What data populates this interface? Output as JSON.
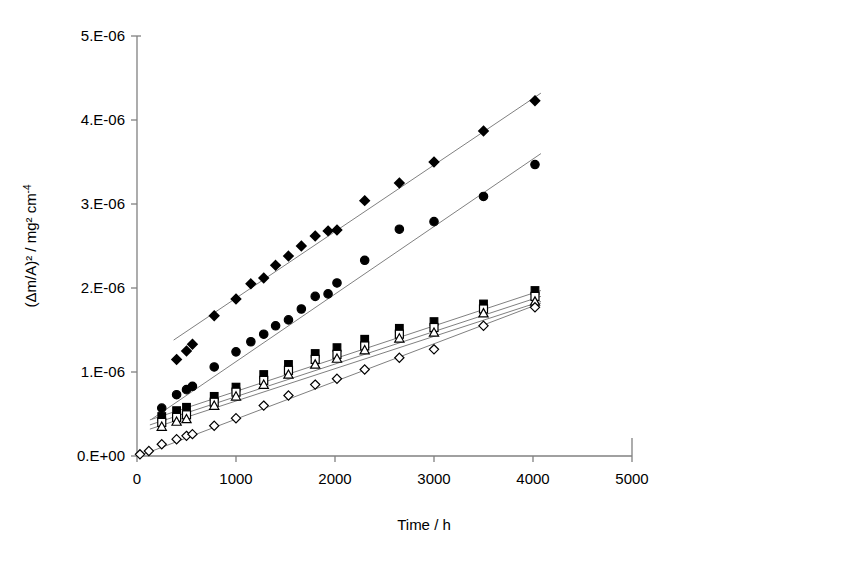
{
  "figure": {
    "background_color": "#ffffff",
    "axis_color": "#808080",
    "marker_color": "#000000",
    "trendline_color": "#808080"
  },
  "axes": {
    "y": {
      "title_main": "(Δm/A)² / mg² cm",
      "title_sup": "-4",
      "tick_labels": [
        "5.E-06",
        "4.E-06",
        "3.E-06",
        "2.E-06",
        "1.E-06",
        "0.E+00"
      ],
      "tick_values": [
        5e-06,
        4e-06,
        3e-06,
        2e-06,
        1e-06,
        0
      ],
      "min": 0,
      "max": 5e-06
    },
    "x": {
      "title": "Time / h",
      "tick_labels": [
        "0",
        "1000",
        "2000",
        "3000",
        "4000",
        "5000"
      ],
      "tick_values": [
        0,
        1000,
        2000,
        3000,
        4000,
        5000
      ],
      "min": 0,
      "max": 5000
    }
  },
  "chart_data": {
    "type": "scatter",
    "title": "",
    "subtitle": "",
    "xlabel": "Time / h",
    "ylabel": "(Δm/A)² / mg² cm-4",
    "xlim": [
      0,
      5000
    ],
    "ylim": [
      0,
      5e-06
    ],
    "grid": false,
    "legend": "none",
    "xticks": [
      0,
      1000,
      2000,
      3000,
      4000,
      5000
    ],
    "yticks": [
      0,
      1e-06,
      2e-06,
      3e-06,
      4e-06,
      5e-06
    ],
    "series": [
      {
        "name": "Series 1",
        "marker": "filled-diamond",
        "color": "#000000",
        "x": [
          400,
          500,
          560,
          780,
          1000,
          1150,
          1280,
          1400,
          1530,
          1660,
          1800,
          1930,
          2020,
          2300,
          2650,
          3000,
          3500,
          4020
        ],
        "y": [
          1.15e-06,
          1.25e-06,
          1.33e-06,
          1.67e-06,
          1.87e-06,
          2.05e-06,
          2.12e-06,
          2.27e-06,
          2.38e-06,
          2.5e-06,
          2.62e-06,
          2.68e-06,
          2.69e-06,
          3.04e-06,
          3.25e-06,
          3.5e-06,
          3.87e-06,
          4.23e-06
        ],
        "trendline": {
          "x0": 370,
          "y0": 1.38e-06,
          "x1": 4080,
          "y1": 4.32e-06
        }
      },
      {
        "name": "Series 2",
        "marker": "filled-circle",
        "color": "#000000",
        "x": [
          250,
          400,
          500,
          560,
          780,
          1000,
          1150,
          1280,
          1400,
          1530,
          1660,
          1800,
          1930,
          2020,
          2300,
          2650,
          3000,
          3500,
          4020
        ],
        "y": [
          5.7e-07,
          7.3e-07,
          7.9e-07,
          8.3e-07,
          1.06e-06,
          1.24e-06,
          1.36e-06,
          1.45e-06,
          1.55e-06,
          1.62e-06,
          1.75e-06,
          1.9e-06,
          1.93e-06,
          2.06e-06,
          2.33e-06,
          2.7e-06,
          2.79e-06,
          3.09e-06,
          3.47e-06
        ],
        "trendline": {
          "x0": 150,
          "y0": 4.4e-07,
          "x1": 4080,
          "y1": 3.6e-06
        }
      },
      {
        "name": "Series 3",
        "marker": "filled-square",
        "color": "#000000",
        "x": [
          250,
          400,
          500,
          780,
          1000,
          1280,
          1530,
          1800,
          2020,
          2300,
          2650,
          3000,
          3500,
          4020
        ],
        "y": [
          4.7e-07,
          5.4e-07,
          5.8e-07,
          7.1e-07,
          8.2e-07,
          9.7e-07,
          1.09e-06,
          1.22e-06,
          1.29e-06,
          1.39e-06,
          1.52e-06,
          1.6e-06,
          1.81e-06,
          1.97e-06
        ],
        "trendline": {
          "x0": 130,
          "y0": 4.3e-07,
          "x1": 4080,
          "y1": 1.97e-06
        }
      },
      {
        "name": "Series 4",
        "marker": "open-square",
        "color": "#000000",
        "x": [
          250,
          400,
          500,
          780,
          1000,
          1280,
          1530,
          1800,
          2020,
          2300,
          2650,
          3000,
          3500,
          4020
        ],
        "y": [
          4e-07,
          4.6e-07,
          4.9e-07,
          6.4e-07,
          7.6e-07,
          9e-07,
          1.02e-06,
          1.15e-06,
          1.21e-06,
          1.31e-06,
          1.45e-06,
          1.53e-06,
          1.75e-06,
          1.9e-06
        ],
        "trendline": {
          "x0": 130,
          "y0": 3.7e-07,
          "x1": 4080,
          "y1": 1.9e-06
        }
      },
      {
        "name": "Series 5",
        "marker": "open-triangle",
        "color": "#000000",
        "x": [
          250,
          400,
          500,
          780,
          1000,
          1280,
          1530,
          1800,
          2020,
          2300,
          2650,
          3000,
          3500,
          4020
        ],
        "y": [
          3.5e-07,
          4.1e-07,
          4.4e-07,
          6e-07,
          7.1e-07,
          8.5e-07,
          9.7e-07,
          1.09e-06,
          1.16e-06,
          1.26e-06,
          1.4e-06,
          1.47e-06,
          1.7e-06,
          1.84e-06
        ],
        "trendline": {
          "x0": 130,
          "y0": 3.2e-07,
          "x1": 4080,
          "y1": 1.84e-06
        }
      },
      {
        "name": "Series 6",
        "marker": "open-diamond",
        "color": "#000000",
        "x": [
          30,
          120,
          250,
          400,
          500,
          560,
          780,
          1000,
          1280,
          1530,
          1800,
          2020,
          2300,
          2650,
          3000,
          3500,
          4020
        ],
        "y": [
          2e-08,
          6e-08,
          1.4e-07,
          2e-07,
          2.4e-07,
          2.6e-07,
          3.6e-07,
          4.5e-07,
          6e-07,
          7.2e-07,
          8.5e-07,
          9.2e-07,
          1.03e-06,
          1.17e-06,
          1.27e-06,
          1.55e-06,
          1.77e-06
        ],
        "trendline": {
          "x0": 20,
          "y0": 0.0,
          "x1": 4080,
          "y1": 1.82e-06
        }
      }
    ]
  }
}
